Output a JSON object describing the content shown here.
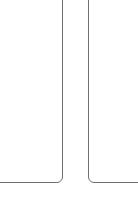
{
  "panels": [
    {
      "id": "left",
      "content": ""
    },
    {
      "id": "right",
      "content": ""
    }
  ],
  "colors": {
    "background": "#ffffff",
    "border": "#6f6f6f"
  }
}
